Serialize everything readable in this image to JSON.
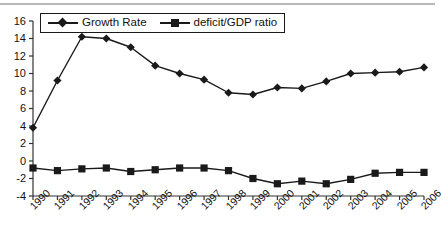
{
  "chart_data": {
    "type": "line",
    "title": "",
    "subtitle": "",
    "xlabel": "",
    "ylabel": "",
    "grid": false,
    "legend_position": "top-left",
    "categories": [
      "1990",
      "1991",
      "1992",
      "1993",
      "1994",
      "1995",
      "1996",
      "1997",
      "1998",
      "1999",
      "2000",
      "2001",
      "2002",
      "2003",
      "2004",
      "2005",
      "2006"
    ],
    "xlim": [
      1990,
      2006
    ],
    "ylim": [
      -4,
      16
    ],
    "yticks": [
      -4,
      -2,
      0,
      2,
      4,
      6,
      8,
      10,
      12,
      14,
      16
    ],
    "ytick_labels": [
      "-4",
      "-2",
      "0",
      "2",
      "4",
      "6",
      "8",
      "10",
      "12",
      "14",
      "16"
    ],
    "series": [
      {
        "name": "Growth Rate",
        "marker": "diamond",
        "color": "#1a1a1a",
        "values": [
          3.8,
          9.2,
          14.2,
          14.0,
          13.0,
          10.9,
          10.0,
          9.3,
          7.8,
          7.6,
          8.4,
          8.3,
          9.1,
          10.0,
          10.1,
          10.2,
          10.7
        ]
      },
      {
        "name": "deficit/GDP ratio",
        "marker": "square",
        "color": "#1a1a1a",
        "values": [
          -0.8,
          -1.1,
          -0.9,
          -0.8,
          -1.2,
          -1.0,
          -0.8,
          -0.8,
          -1.1,
          -2.0,
          -2.6,
          -2.3,
          -2.6,
          -2.1,
          -1.4,
          -1.3,
          -1.3
        ]
      }
    ]
  },
  "legend": {
    "entries": [
      {
        "label": "Growth Rate",
        "marker": "diamond"
      },
      {
        "label": "deficit/GDP ratio",
        "marker": "square"
      }
    ]
  },
  "colors": {
    "ink": "#1a1a1a",
    "axis": "#333333",
    "rule": "#b9b9b9",
    "background": "#ffffff"
  }
}
